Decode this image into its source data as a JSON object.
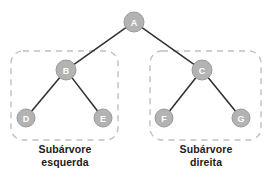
{
  "diagram": {
    "colors": {
      "node_fill": "#b3b3b3",
      "node_stroke": "#9a9a9a",
      "node_text": "#ffffff",
      "edge": "#333333",
      "subtree_border": "#c0c0c0",
      "background": "#ffffff",
      "caption_text": "#1c1c1c"
    },
    "nodes": [
      {
        "id": "A",
        "label": "A",
        "cx": 134,
        "cy": 22,
        "r": 10
      },
      {
        "id": "B",
        "label": "B",
        "cx": 66,
        "cy": 70,
        "r": 10
      },
      {
        "id": "C",
        "label": "C",
        "cx": 202,
        "cy": 70,
        "r": 10
      },
      {
        "id": "D",
        "label": "D",
        "cx": 26,
        "cy": 118,
        "r": 9
      },
      {
        "id": "E",
        "label": "E",
        "cx": 103,
        "cy": 118,
        "r": 9
      },
      {
        "id": "F",
        "label": "F",
        "cx": 164,
        "cy": 118,
        "r": 9
      },
      {
        "id": "G",
        "label": "G",
        "cx": 241,
        "cy": 118,
        "r": 9
      }
    ],
    "edges": [
      {
        "from": "A",
        "to": "B"
      },
      {
        "from": "A",
        "to": "C"
      },
      {
        "from": "B",
        "to": "D"
      },
      {
        "from": "B",
        "to": "E"
      },
      {
        "from": "C",
        "to": "F"
      },
      {
        "from": "C",
        "to": "G"
      }
    ],
    "subtrees": [
      {
        "id": "left",
        "caption_line1": "Subárvore",
        "caption_line2": "esquerda",
        "box": {
          "x": 11,
          "y": 51,
          "width": 107,
          "height": 89,
          "rx": 12
        },
        "contains": [
          "B",
          "D",
          "E"
        ]
      },
      {
        "id": "right",
        "caption_line1": "Subárvore",
        "caption_line2": "direita",
        "box": {
          "x": 150,
          "y": 51,
          "width": 111,
          "height": 89,
          "rx": 12
        },
        "contains": [
          "C",
          "F",
          "G"
        ]
      }
    ]
  }
}
